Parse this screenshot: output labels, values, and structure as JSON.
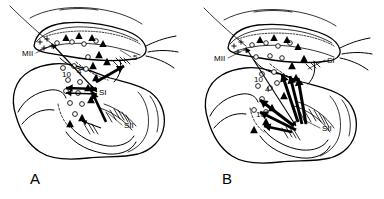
{
  "figure": {
    "background_color": "#ffffff",
    "line_color": "#000000",
    "width": 384,
    "height": 199
  },
  "panels": [
    {
      "id": "A",
      "letter": "A",
      "letter_position": {
        "x": 30,
        "y": 184
      },
      "labels": [
        {
          "name": "area-mii",
          "text": "MII",
          "x": 22,
          "y": 56,
          "size": 8.2
        },
        {
          "name": "area-5",
          "text": "5",
          "x": 133,
          "y": 60,
          "size": 8.2
        },
        {
          "name": "area-si",
          "text": "SI",
          "x": 99,
          "y": 95,
          "size": 8.2
        },
        {
          "name": "area-sii",
          "text": "SII",
          "x": 124,
          "y": 128,
          "size": 8.2
        },
        {
          "name": "area-10",
          "text": "10",
          "x": 62,
          "y": 77,
          "size": 8.0
        },
        {
          "name": "area-4",
          "text": "4",
          "x": 77,
          "y": 74,
          "size": 8.0
        }
      ],
      "leaders": [
        {
          "name": "leader-mii",
          "x1": 36,
          "y1": 53,
          "x2": 52,
          "y2": 45
        },
        {
          "name": "leader-5",
          "x1": 131,
          "y1": 57,
          "x2": 120,
          "y2": 50
        },
        {
          "name": "leader-sii",
          "x1": 122,
          "y1": 125,
          "x2": 108,
          "y2": 113
        }
      ],
      "markers": {
        "open_circles": [
          {
            "x": 57,
            "y": 43,
            "r": 2.3
          },
          {
            "x": 72,
            "y": 42,
            "r": 2.3
          },
          {
            "x": 84,
            "y": 44,
            "r": 2.3
          },
          {
            "x": 96,
            "y": 41,
            "r": 2.3
          },
          {
            "x": 63,
            "y": 68,
            "r": 2.4
          },
          {
            "x": 74,
            "y": 66,
            "r": 2.4
          },
          {
            "x": 86,
            "y": 69,
            "r": 2.4
          },
          {
            "x": 68,
            "y": 80,
            "r": 2.4
          },
          {
            "x": 80,
            "y": 82,
            "r": 2.4
          },
          {
            "x": 66,
            "y": 91,
            "r": 2.4
          },
          {
            "x": 78,
            "y": 93,
            "r": 2.4
          },
          {
            "x": 70,
            "y": 103,
            "r": 2.4
          },
          {
            "x": 82,
            "y": 104,
            "r": 2.4
          },
          {
            "x": 75,
            "y": 114,
            "r": 2.4
          },
          {
            "x": 88,
            "y": 57,
            "r": 2.3
          }
        ],
        "filled_triangles": [
          {
            "x": 66,
            "y": 38,
            "s": 4.0
          },
          {
            "x": 79,
            "y": 36,
            "s": 4.0
          },
          {
            "x": 92,
            "y": 38,
            "s": 4.0
          },
          {
            "x": 103,
            "y": 44,
            "s": 4.0
          },
          {
            "x": 99,
            "y": 55,
            "s": 4.2
          },
          {
            "x": 107,
            "y": 62,
            "s": 4.2
          },
          {
            "x": 93,
            "y": 66,
            "s": 4.2
          },
          {
            "x": 96,
            "y": 78,
            "s": 4.2
          },
          {
            "x": 88,
            "y": 88,
            "s": 4.2
          },
          {
            "x": 91,
            "y": 100,
            "s": 4.2
          },
          {
            "x": 82,
            "y": 118,
            "s": 4.2
          },
          {
            "x": 70,
            "y": 124,
            "s": 4.2
          }
        ],
        "crosses": [
          {
            "x": 40,
            "y": 42,
            "s": 2.6
          },
          {
            "x": 47,
            "y": 39,
            "s": 2.6
          },
          {
            "x": 44,
            "y": 48,
            "s": 2.6
          },
          {
            "x": 52,
            "y": 46,
            "s": 2.6
          }
        ]
      },
      "arrows": [
        {
          "name": "arrow-mii-to-si",
          "x1": 52,
          "y1": 44,
          "x2": 97,
          "y2": 92,
          "width": 1.1,
          "head": "both"
        },
        {
          "name": "arrow-si-lateral",
          "x1": 66,
          "y1": 88,
          "x2": 97,
          "y2": 89,
          "width": 2.4,
          "head": "both"
        },
        {
          "name": "arrow-si-lateral2",
          "x1": 66,
          "y1": 93,
          "x2": 97,
          "y2": 94,
          "width": 1.6,
          "head": "both"
        },
        {
          "name": "arrow-5-to-si",
          "x1": 124,
          "y1": 66,
          "x2": 96,
          "y2": 82,
          "width": 2.6,
          "head": "start"
        },
        {
          "name": "arrow-si-to-sii",
          "x1": 92,
          "y1": 92,
          "x2": 106,
          "y2": 122,
          "width": 2.6,
          "head": "start"
        },
        {
          "name": "arrow-sii-in",
          "x1": 101,
          "y1": 128,
          "x2": 82,
          "y2": 121,
          "width": 1.1,
          "head": "end"
        }
      ]
    },
    {
      "id": "B",
      "letter": "B",
      "letter_position": {
        "x": 30,
        "y": 184
      },
      "labels": [
        {
          "name": "area-mii",
          "text": "MII",
          "x": 22,
          "y": 61,
          "size": 8.2
        },
        {
          "name": "area-si",
          "text": "SI",
          "x": 135,
          "y": 63,
          "size": 8.2
        },
        {
          "name": "area-sii",
          "text": "SII",
          "x": 130,
          "y": 131,
          "size": 8.2
        },
        {
          "name": "area-10",
          "text": "10",
          "x": 62,
          "y": 82,
          "size": 8.0
        },
        {
          "name": "area-4",
          "text": "4",
          "x": 73,
          "y": 92,
          "size": 8.0
        },
        {
          "name": "area-10b",
          "text": "10",
          "x": 64,
          "y": 117,
          "size": 8.0
        }
      ],
      "leaders": [
        {
          "name": "leader-mii",
          "x1": 36,
          "y1": 58,
          "x2": 54,
          "y2": 49
        },
        {
          "name": "leader-si",
          "x1": 133,
          "y1": 60,
          "x2": 116,
          "y2": 69
        },
        {
          "name": "leader-sii",
          "x1": 128,
          "y1": 128,
          "x2": 112,
          "y2": 120
        }
      ],
      "markers": {
        "open_circles": [
          {
            "x": 60,
            "y": 45,
            "r": 2.3
          },
          {
            "x": 74,
            "y": 43,
            "r": 2.3
          },
          {
            "x": 86,
            "y": 46,
            "r": 2.3
          },
          {
            "x": 98,
            "y": 43,
            "r": 2.3
          },
          {
            "x": 64,
            "y": 57,
            "r": 2.3
          },
          {
            "x": 78,
            "y": 56,
            "r": 2.3
          },
          {
            "x": 90,
            "y": 58,
            "r": 2.3
          },
          {
            "x": 70,
            "y": 74,
            "r": 2.4
          },
          {
            "x": 82,
            "y": 72,
            "r": 2.4
          },
          {
            "x": 66,
            "y": 86,
            "r": 2.4
          },
          {
            "x": 78,
            "y": 88,
            "r": 2.4
          },
          {
            "x": 70,
            "y": 99,
            "r": 2.4
          },
          {
            "x": 62,
            "y": 110,
            "r": 2.4
          },
          {
            "x": 74,
            "y": 112,
            "r": 2.4
          },
          {
            "x": 85,
            "y": 83,
            "r": 2.4
          }
        ],
        "filled_triangles": [
          {
            "x": 68,
            "y": 40,
            "s": 4.0
          },
          {
            "x": 82,
            "y": 38,
            "s": 4.0
          },
          {
            "x": 95,
            "y": 40,
            "s": 4.0
          },
          {
            "x": 106,
            "y": 47,
            "s": 4.0
          },
          {
            "x": 112,
            "y": 59,
            "s": 4.2
          },
          {
            "x": 100,
            "y": 66,
            "s": 4.2
          },
          {
            "x": 104,
            "y": 78,
            "s": 4.2
          },
          {
            "x": 92,
            "y": 96,
            "s": 4.2
          },
          {
            "x": 80,
            "y": 108,
            "s": 4.2
          },
          {
            "x": 74,
            "y": 122,
            "s": 4.2
          },
          {
            "x": 62,
            "y": 130,
            "s": 4.2
          }
        ],
        "crosses": [
          {
            "x": 42,
            "y": 46,
            "s": 2.6
          },
          {
            "x": 49,
            "y": 42,
            "s": 2.6
          },
          {
            "x": 46,
            "y": 52,
            "s": 2.6
          },
          {
            "x": 54,
            "y": 50,
            "s": 2.6
          }
        ]
      },
      "arrows": [
        {
          "name": "arrow-mii-to-sii",
          "x1": 54,
          "y1": 48,
          "x2": 104,
          "y2": 126,
          "width": 1.1,
          "head": "both"
        },
        {
          "name": "arrow-bundle-1",
          "x1": 106,
          "y1": 122,
          "x2": 90,
          "y2": 74,
          "width": 3.0,
          "head": "end"
        },
        {
          "name": "arrow-bundle-2",
          "x1": 110,
          "y1": 124,
          "x2": 98,
          "y2": 76,
          "width": 3.0,
          "head": "end"
        },
        {
          "name": "arrow-bundle-3",
          "x1": 114,
          "y1": 124,
          "x2": 106,
          "y2": 78,
          "width": 3.0,
          "head": "end"
        },
        {
          "name": "arrow-bundle-4",
          "x1": 102,
          "y1": 126,
          "x2": 68,
          "y2": 100,
          "width": 3.0,
          "head": "end"
        },
        {
          "name": "arrow-bundle-5",
          "x1": 104,
          "y1": 130,
          "x2": 68,
          "y2": 112,
          "width": 3.0,
          "head": "end"
        },
        {
          "name": "arrow-bundle-6",
          "x1": 100,
          "y1": 132,
          "x2": 72,
          "y2": 126,
          "width": 2.4,
          "head": "end"
        }
      ]
    }
  ]
}
